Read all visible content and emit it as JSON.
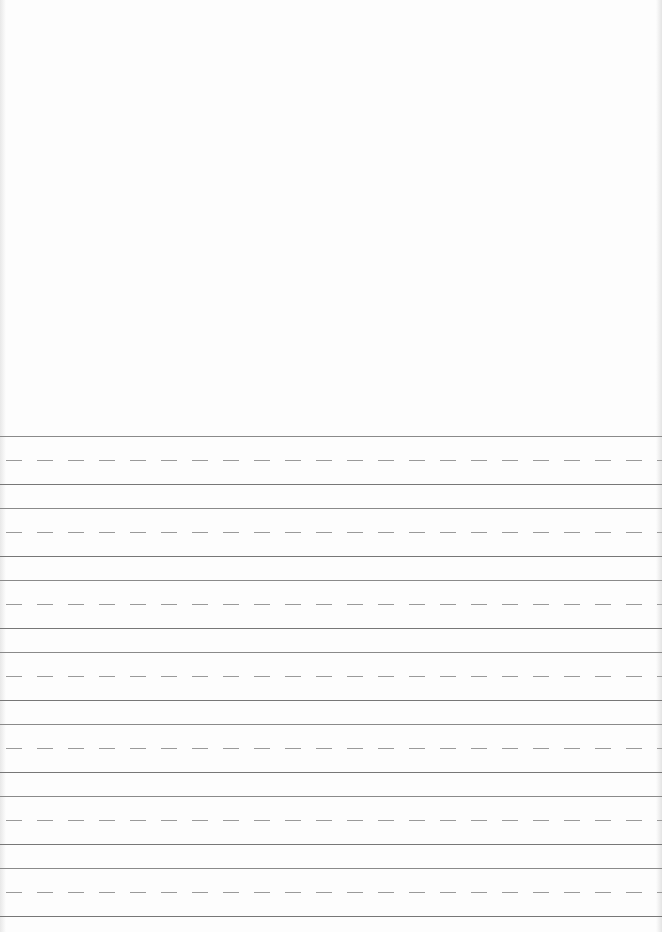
{
  "page": {
    "type": "handwriting-practice-sheet",
    "blank_area": "top",
    "line_groups": 7,
    "colors": {
      "paper": "#fdfdfd",
      "line": "#8a8a8a",
      "dashed": "#9a9a9a"
    }
  }
}
